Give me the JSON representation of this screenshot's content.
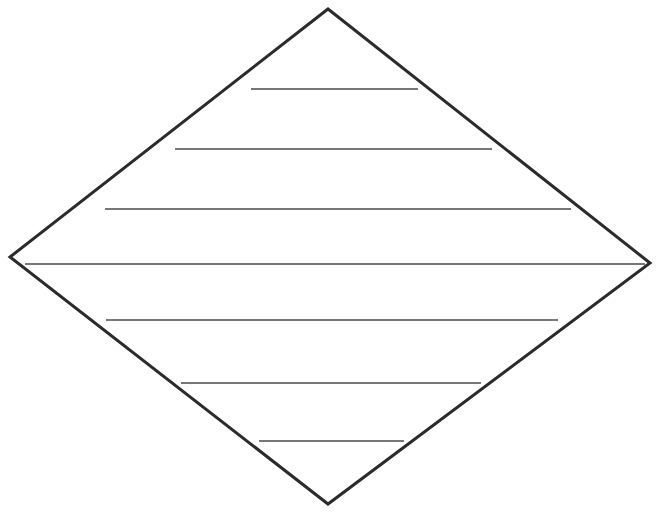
{
  "document": {
    "title": "Diamond Diagram Template",
    "background_color": "#ffffff",
    "width": 657,
    "height": 516
  },
  "chart_data": {
    "type": "diagram",
    "title": "",
    "subtitle": "",
    "xlabel": "",
    "ylabel": "",
    "annotations": [],
    "legend": [],
    "grid": false,
    "shape": {
      "name": "diamond",
      "kind": "rhombus-outline",
      "stroke_color": "#2b2b2b",
      "stroke_width": 3,
      "fill_color": "#ffffff",
      "vertices": {
        "top": {
          "x": 328,
          "y": 9
        },
        "right": {
          "x": 650,
          "y": 263
        },
        "bottom": {
          "x": 328,
          "y": 504
        },
        "left": {
          "x": 10,
          "y": 257
        }
      },
      "vertex_order": [
        "top",
        "right",
        "bottom",
        "left"
      ]
    },
    "divider_lines": [
      {
        "index": 1,
        "label": "",
        "y": 89,
        "x1": 251,
        "x2": 418,
        "length": 167,
        "stroke_color": "#4a4a4a",
        "stroke_width": 1.3
      },
      {
        "index": 2,
        "label": "",
        "y": 149,
        "x1": 175,
        "x2": 492,
        "length": 317,
        "stroke_color": "#4a4a4a",
        "stroke_width": 1.3
      },
      {
        "index": 3,
        "label": "",
        "y": 209,
        "x1": 105,
        "x2": 571,
        "length": 466,
        "stroke_color": "#4a4a4a",
        "stroke_width": 1.3
      },
      {
        "index": 4,
        "label": "",
        "y": 264,
        "x1": 25,
        "x2": 645,
        "length": 620,
        "stroke_color": "#4a4a4a",
        "stroke_width": 1.3
      },
      {
        "index": 5,
        "label": "",
        "y": 320,
        "x1": 106,
        "x2": 558,
        "length": 452,
        "stroke_color": "#4a4a4a",
        "stroke_width": 1.3
      },
      {
        "index": 6,
        "label": "",
        "y": 383,
        "x1": 181,
        "x2": 481,
        "length": 300,
        "stroke_color": "#4a4a4a",
        "stroke_width": 1.3
      },
      {
        "index": 7,
        "label": "",
        "y": 441,
        "x1": 259,
        "x2": 404,
        "length": 145,
        "stroke_color": "#4a4a4a",
        "stroke_width": 1.3
      }
    ],
    "band_count": 8,
    "labels": []
  }
}
